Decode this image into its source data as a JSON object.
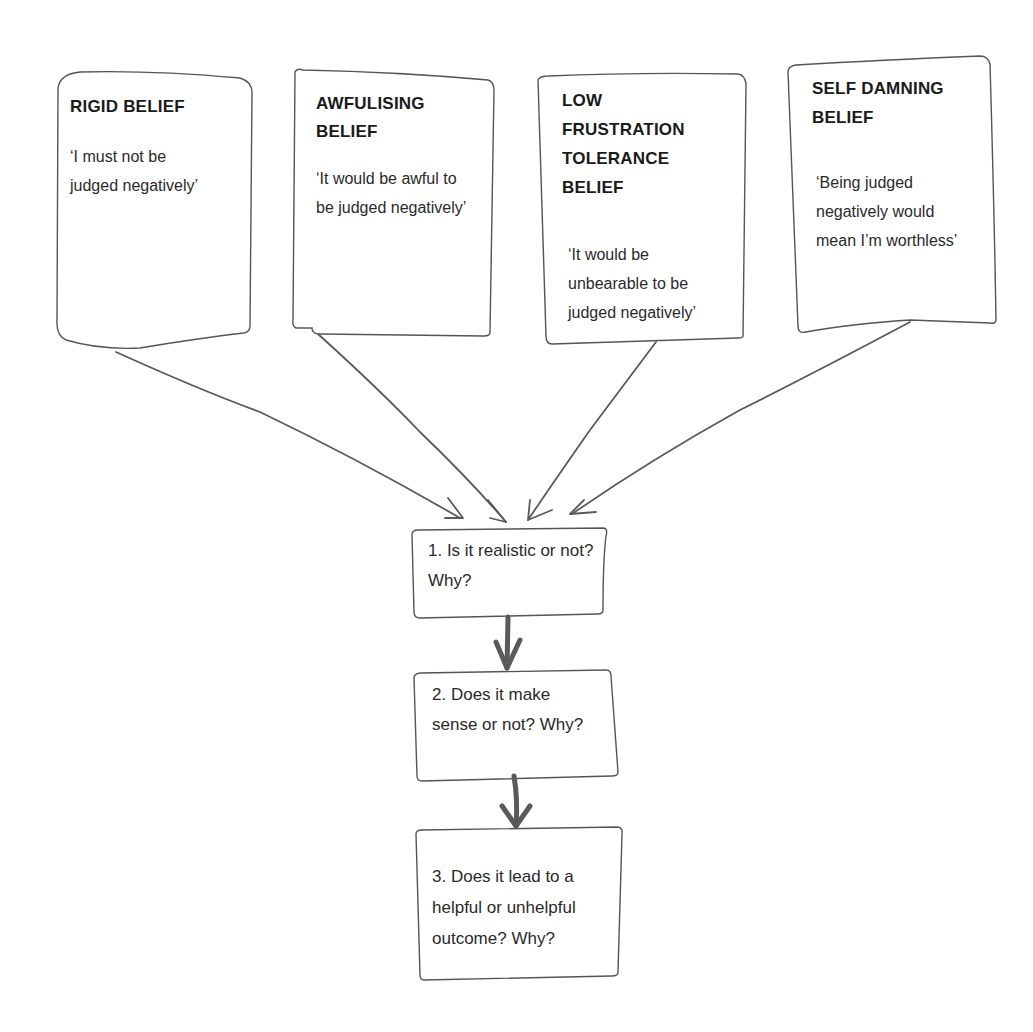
{
  "beliefs": [
    {
      "title": "RIGID BELIEF",
      "quote": "‘I must not be judged negatively’"
    },
    {
      "title": "AWFULISING BELIEF",
      "quote": "‘It would be awful to be judged negatively’"
    },
    {
      "title": "LOW FRUSTRATION TOLERANCE BELIEF",
      "quote": "‘It would be unbearable to be judged negatively’"
    },
    {
      "title": "SELF DAMNING BELIEF",
      "quote": "‘Being judged negatively would mean I’m worthless’"
    }
  ],
  "steps": [
    {
      "text": "1. Is it realistic or not? Why?"
    },
    {
      "text": "2. Does it make sense or not? Why?"
    },
    {
      "text": "3. Does it lead to a helpful or unhelpful outcome? Why?"
    }
  ],
  "colors": {
    "stroke": "#555555",
    "arrow": "#5a5a5a",
    "background": "#ffffff"
  }
}
